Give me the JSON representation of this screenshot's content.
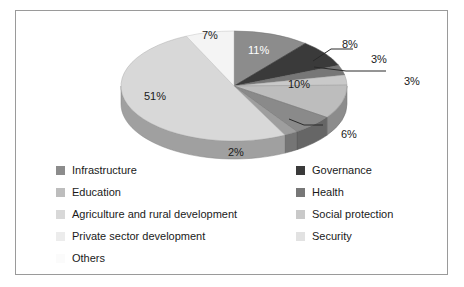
{
  "chart_data": {
    "type": "pie",
    "title": "",
    "xlabel": "",
    "ylabel": "",
    "legend_position": "bottom",
    "grid": false,
    "three_d": true,
    "categories": [
      "Infrastructure",
      "Governance",
      "Health",
      "Social protection",
      "Education",
      "Security",
      "Private sector development",
      "Agriculture and rural development",
      "Others"
    ],
    "values": [
      11,
      8,
      3,
      3,
      10,
      6,
      2,
      51,
      7
    ],
    "labels": [
      "11%",
      "8%",
      "3%",
      "3%",
      "10%",
      "6%",
      "2%",
      "51%",
      "7%"
    ],
    "colors": [
      "#8c8c8c",
      "#3a3a3a",
      "#777777",
      "#c9c9c9",
      "#bdbdbd",
      "#8a8a8a",
      "#9e9e9e",
      "#d8d8d8",
      "#f4f4f4"
    ],
    "slices": [
      {
        "name": "Infrastructure",
        "value": 11,
        "label": "11%",
        "color": "#8c8c8c"
      },
      {
        "name": "Governance",
        "value": 8,
        "label": "8%",
        "color": "#3a3a3a"
      },
      {
        "name": "Health",
        "value": 3,
        "label": "3%",
        "color": "#777777"
      },
      {
        "name": "Social protection",
        "value": 3,
        "label": "3%",
        "color": "#c9c9c9"
      },
      {
        "name": "Education",
        "value": 10,
        "label": "10%",
        "color": "#bdbdbd"
      },
      {
        "name": "Security",
        "value": 6,
        "label": "6%",
        "color": "#8a8a8a"
      },
      {
        "name": "Private sector development",
        "value": 2,
        "label": "2%",
        "color": "#9e9e9e"
      },
      {
        "name": "Agriculture and rural development",
        "value": 51,
        "label": "51%",
        "color": "#d8d8d8"
      },
      {
        "name": "Others",
        "value": 7,
        "label": "7%",
        "color": "#f4f4f4"
      }
    ]
  },
  "labels": {
    "p11": "11%",
    "p8": "8%",
    "p3a": "3%",
    "p3b": "3%",
    "p10": "10%",
    "p6": "6%",
    "p2": "2%",
    "p51": "51%",
    "p7": "7%"
  },
  "legend": {
    "left_column": [
      {
        "label": "Infrastructure",
        "color": "#8c8c8c"
      },
      {
        "label": "Education",
        "color": "#bdbdbd"
      },
      {
        "label": "Agriculture and rural development",
        "color": "#d8d8d8"
      },
      {
        "label": "Private sector development",
        "color": "#ececec"
      },
      {
        "label": "Others",
        "color": "#fbfbfb"
      }
    ],
    "right_column": [
      {
        "label": "Governance",
        "color": "#3a3a3a"
      },
      {
        "label": "Health",
        "color": "#777777"
      },
      {
        "label": "Social protection",
        "color": "#c9c9c9"
      },
      {
        "label": "Security",
        "color": "#e2e2e2"
      }
    ]
  },
  "style": {
    "border_color": "#9a9a9a",
    "background": "#ffffff",
    "text_color": "#1a1a1a"
  }
}
